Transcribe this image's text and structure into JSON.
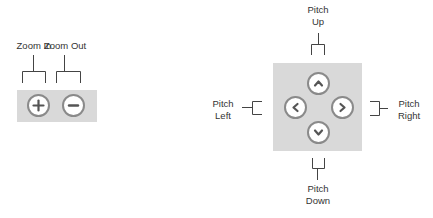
{
  "zoom_controls": {
    "zoom_in": {
      "label": "Zoom In",
      "icon": "plus-icon"
    },
    "zoom_out": {
      "label": "Zoom Out",
      "icon": "minus-icon"
    }
  },
  "pitch_controls": {
    "up": {
      "label_line1": "Pitch",
      "label_line2": "Up",
      "icon": "chevron-up-icon"
    },
    "left": {
      "label_line1": "Pitch",
      "label_line2": "Left",
      "icon": "chevron-left-icon"
    },
    "right": {
      "label_line1": "Pitch",
      "label_line2": "Right",
      "icon": "chevron-right-icon"
    },
    "down": {
      "label_line1": "Pitch",
      "label_line2": "Down",
      "icon": "chevron-down-icon"
    }
  },
  "colors": {
    "panel": "#d9d9d9",
    "button_fill": "#ffffff",
    "button_ring": "#8a8a8a",
    "glyph": "#555555",
    "bracket": "#444444"
  }
}
